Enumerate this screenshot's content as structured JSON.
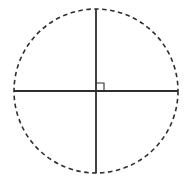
{
  "figure": {
    "background_color": "#ffffff",
    "stroke_color": "#2e2e2e",
    "canvas": {
      "width": 188,
      "height": 181,
      "viewbox": "0 0 188 181"
    },
    "circle": {
      "cx": 96,
      "cy": 91,
      "r": 82,
      "dash_pattern": "4.5 3.5",
      "stroke_width": 1.6
    },
    "horizontal_diameter": {
      "x1": 14,
      "y1": 91,
      "x2": 178,
      "y2": 91,
      "stroke_width": 1.8
    },
    "vertical_diameter": {
      "x1": 96,
      "y1": 9,
      "x2": 96,
      "y2": 173,
      "stroke_width": 1.8
    },
    "right_angle_marker": {
      "points": "96,83 104,83 104,91",
      "stroke_width": 1.1
    }
  }
}
